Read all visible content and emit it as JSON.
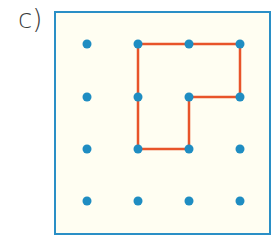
{
  "label": "c)",
  "colors": {
    "border": "#2a8fc6",
    "background": "#fffef2",
    "dot": "#1f8dc2",
    "shape": "#e8542a"
  },
  "grid": {
    "columns": [
      87,
      138,
      189,
      240
    ],
    "rows": [
      44,
      97,
      149,
      201
    ],
    "dot_radius": 4.5
  },
  "shape": {
    "description": "L-shaped polygon drawn on 4x4 dot grid",
    "vertices_grid": [
      [
        1,
        0
      ],
      [
        3,
        0
      ],
      [
        3,
        1
      ],
      [
        2,
        1
      ],
      [
        2,
        2
      ],
      [
        1,
        2
      ]
    ]
  }
}
